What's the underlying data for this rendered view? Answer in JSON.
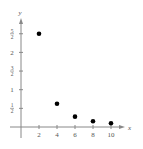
{
  "chart_data": {
    "type": "scatter",
    "title": "",
    "xlabel": "x",
    "ylabel": "y",
    "x": [
      2,
      4,
      6,
      8,
      10
    ],
    "y": [
      2.5,
      0.625,
      0.278,
      0.156,
      0.1
    ],
    "series": [
      {
        "name": "points",
        "x": [
          2,
          4,
          6,
          8,
          10
        ],
        "y": [
          2.5,
          0.625,
          0.278,
          0.156,
          0.1
        ]
      }
    ],
    "xticks": [
      2,
      4,
      6,
      8,
      10
    ],
    "xtick_labels": [
      "2",
      "4",
      "6",
      "8",
      "10"
    ],
    "yticks": [
      0.5,
      1,
      1.5,
      2,
      2.5
    ],
    "ytick_labels": [
      "1/2",
      "1",
      "3/2",
      "2",
      "5/2"
    ],
    "xlim": [
      0,
      11.5
    ],
    "ylim": [
      0,
      2.8
    ],
    "grid": false,
    "legend": null
  },
  "labels": {
    "x_axis": "x",
    "y_axis": "y"
  },
  "colors": {
    "axis": "#888888",
    "point": "#000000",
    "text": "#555555"
  }
}
